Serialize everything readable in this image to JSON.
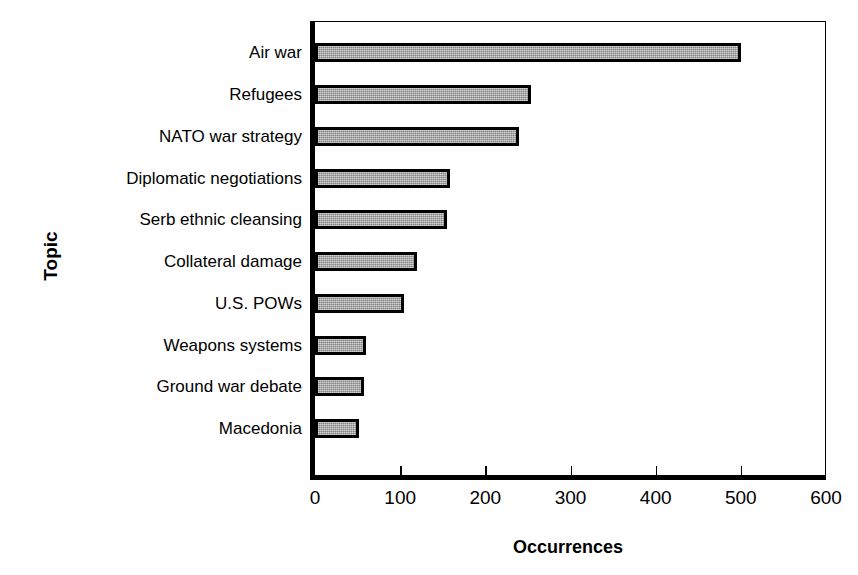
{
  "chart_data": {
    "type": "bar",
    "orientation": "horizontal",
    "title": "",
    "xlabel": "Occurrences",
    "ylabel": "Topic",
    "categories": [
      "Air war",
      "Refugees",
      "NATO war strategy",
      "Diplomatic negotiations",
      "Serb ethnic cleansing",
      "Collateral damage",
      "U.S. POWs",
      "Weapons systems",
      "Ground war debate",
      "Macedonia"
    ],
    "values": [
      500,
      253,
      240,
      158,
      155,
      120,
      105,
      60,
      58,
      52
    ],
    "xlim": [
      0,
      600
    ],
    "xticks": [
      0,
      100,
      200,
      300,
      400,
      500,
      600
    ],
    "xtick_labels": [
      "0",
      "100",
      "200",
      "300",
      "400",
      "500",
      "600"
    ],
    "grid": false,
    "legend": false,
    "bar_fill_color": "#a0a0a0",
    "bar_edge_color": "#000000",
    "background_color": "#ffffff"
  }
}
